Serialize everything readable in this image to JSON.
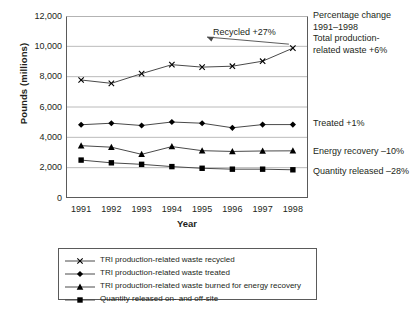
{
  "chart_data": {
    "type": "line",
    "title": "",
    "xlabel": "Year",
    "ylabel": "Pounds (millions)",
    "categories": [
      1991,
      1992,
      1993,
      1994,
      1995,
      1996,
      1997,
      1998
    ],
    "x_tick_labels": [
      "1991",
      "1992",
      "1993",
      "1994",
      "1995",
      "1996",
      "1997",
      "1998"
    ],
    "y_tick_labels": [
      "12,000",
      "10,000",
      "8,000",
      "6,000",
      "4,000",
      "2,000",
      "0"
    ],
    "y_tick_values": [
      12000,
      10000,
      8000,
      6000,
      4000,
      2000,
      0
    ],
    "ylim": [
      0,
      12000
    ],
    "grid": "horizontal",
    "legend_position": "below-plot",
    "series": [
      {
        "name": "TRI production-related waste recycled",
        "marker": "x-cross",
        "short_label": "Recycled",
        "change_label": "+27%",
        "values": [
          7780,
          7560,
          8200,
          8790,
          8630,
          8690,
          9020,
          9880
        ]
      },
      {
        "name": "TRI production-related waste treated",
        "marker": "diamond",
        "short_label": "Treated",
        "change_label": "+1%",
        "values": [
          4830,
          4930,
          4780,
          5010,
          4930,
          4630,
          4840,
          4840
        ]
      },
      {
        "name": "TRI production-related waste burned for energy recovery",
        "marker": "triangle",
        "short_label": "Energy recovery",
        "change_label": "-10%",
        "values": [
          3450,
          3350,
          2880,
          3390,
          3120,
          3070,
          3100,
          3110
        ]
      },
      {
        "name": "Quantity released on- and off-site",
        "marker": "square",
        "short_label": "Quantity released",
        "change_label": "-28%",
        "values": [
          2500,
          2320,
          2220,
          2070,
          1960,
          1900,
          1900,
          1860
        ]
      }
    ],
    "annotations": {
      "header_line1": "Percentage change",
      "header_line2": "1991–1998",
      "header_line3": "Total production-",
      "header_line4": "related  waste +6%",
      "recycled": "Recycled  +27%",
      "treated": "Treated  +1%",
      "energy_recovery": "Energy recovery  –10%",
      "quantity_released": "Quantity released  –28%"
    },
    "colors": {
      "line": "#4a4a4a",
      "marker": "#000000",
      "grid": "#a8a8a8",
      "axis": "#5a5a5a",
      "text": "#231f20"
    }
  },
  "legend": {
    "items": [
      {
        "marker": "x-cross",
        "label": "TRI production-related waste recycled"
      },
      {
        "marker": "diamond",
        "label": "TRI production-related waste treated"
      },
      {
        "marker": "triangle",
        "label": "TRI production-related waste burned for energy recovery"
      },
      {
        "marker": "square",
        "label": "Quantity released on- and off-site"
      }
    ]
  }
}
